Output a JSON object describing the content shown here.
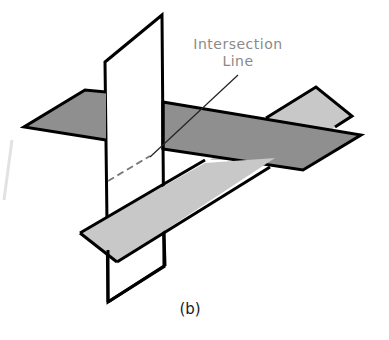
{
  "figure": {
    "annotation": {
      "line1": "Intersection",
      "line2": "Line"
    },
    "caption": "(b)",
    "colors": {
      "dark_plane": "#8f8f8f",
      "light_plane": "#c8c8c8",
      "vertical_plane": "#ffffff",
      "outline": "#000000",
      "annotation_text": "#8a8a8a"
    }
  }
}
